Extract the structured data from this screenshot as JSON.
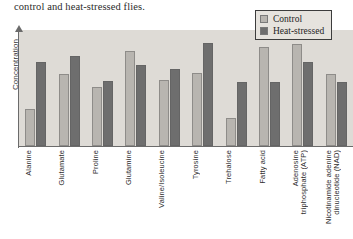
{
  "caption": "control and heat-stressed flies.",
  "legend": {
    "position": "top-right",
    "entries": [
      {
        "label": "Control",
        "color": "#b8b5b0",
        "icon": "legend-swatch-icon"
      },
      {
        "label": "Heat-stressed",
        "color": "#6e6e6e",
        "icon": "legend-swatch-icon"
      }
    ]
  },
  "axes": {
    "ylabel": "Concentration",
    "xlabel": ""
  },
  "chart_data": {
    "type": "bar",
    "title": "",
    "subtitle": "",
    "xlabel": "",
    "ylabel": "Concentration",
    "ylim": [
      0,
      100
    ],
    "grid": false,
    "legend_position": "top-right",
    "categories": [
      "Alanine",
      "Glutamate",
      "Proline",
      "Glutamine",
      "Valine/Isoleucine",
      "Tyrosine",
      "Trehalose",
      "Fatty acid",
      "Adenosine triphosphate (ATP)",
      "Nicotinamide adenine dinucleotide (NAD)"
    ],
    "category_lines": [
      [
        "Alanine"
      ],
      [
        "Glutamate"
      ],
      [
        "Proline"
      ],
      [
        "Glutamine"
      ],
      [
        "Valine/Isoleucine"
      ],
      [
        "Tyrosine"
      ],
      [
        "Trehalose"
      ],
      [
        "Fatty acid"
      ],
      [
        "Adenosine",
        "triphosphate (ATP)"
      ],
      [
        "Nicotinamide adenine",
        "dinucleotide (NAD)"
      ]
    ],
    "series": [
      {
        "name": "Control",
        "color": "#b8b5b0",
        "values": [
          32,
          62,
          51,
          82,
          57,
          63,
          24,
          85,
          88,
          62
        ]
      },
      {
        "name": "Heat-stressed",
        "color": "#6e6e6e",
        "values": [
          72,
          78,
          56,
          70,
          66,
          89,
          55,
          55,
          72,
          55
        ]
      }
    ]
  },
  "colors": {
    "plot_background": "#dedbd6",
    "page_background": "#ffffff",
    "axis": "#6b6b6b",
    "control": "#b8b5b0",
    "heat_stressed": "#6e6e6e"
  }
}
